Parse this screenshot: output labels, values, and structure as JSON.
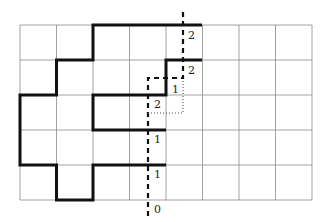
{
  "figure": {
    "grid": {
      "cols": 8,
      "rows": 5,
      "x0": 20,
      "y0": 25,
      "cell_w": 36.5,
      "cell_h": 35,
      "color": "#8a8a8a"
    },
    "thick_path_color": "#111111",
    "dashed_color": "#111111",
    "labels": [
      {
        "text": "2",
        "x": 188,
        "y": 30
      },
      {
        "text": "2",
        "x": 188,
        "y": 65
      },
      {
        "text": "1",
        "x": 172,
        "y": 84
      },
      {
        "text": "2",
        "x": 154,
        "y": 99
      },
      {
        "text": "1",
        "x": 154,
        "y": 134
      },
      {
        "text": "1",
        "x": 154,
        "y": 169
      },
      {
        "text": "0",
        "x": 154,
        "y": 204
      }
    ]
  }
}
